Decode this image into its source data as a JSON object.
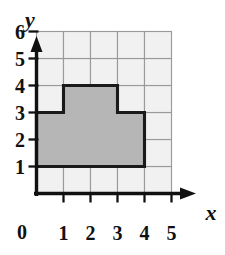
{
  "figure": {
    "kind": "coordinate-grid-shape",
    "background_color": "#ffffff"
  },
  "axes": {
    "x_name": "x",
    "y_name": "y",
    "origin_label": "0",
    "x_ticks": [
      "1",
      "2",
      "3",
      "4",
      "5"
    ],
    "y_ticks": [
      "1",
      "2",
      "3",
      "4",
      "5",
      "6"
    ],
    "axis_color": "#111111",
    "x_range": [
      0,
      5
    ],
    "y_range": [
      0,
      6
    ]
  },
  "grid": {
    "columns": 5,
    "rows": 6,
    "cell_fill": "#f1f1f1",
    "line_color": "#9a9a9a"
  },
  "chart_data": {
    "type": "scatter",
    "title": "",
    "xlabel": "x",
    "ylabel": "y",
    "xlim": [
      0,
      5
    ],
    "ylim": [
      0,
      6
    ],
    "xticks": [
      1,
      2,
      3,
      4,
      5
    ],
    "yticks": [
      1,
      2,
      3,
      4,
      5,
      6
    ],
    "grid": true,
    "legend": "none",
    "annotations": [],
    "shapes": [
      {
        "name": "shaded-step-polygon",
        "type": "polygon",
        "fill": "#b6b6b6",
        "stroke": "#1a1a1a",
        "closed": true,
        "vertices": [
          [
            0,
            1
          ],
          [
            4,
            1
          ],
          [
            4,
            3
          ],
          [
            3,
            3
          ],
          [
            3,
            4
          ],
          [
            1,
            4
          ],
          [
            1,
            3
          ],
          [
            0,
            3
          ]
        ],
        "area_square_units": 10,
        "perimeter_units": 16
      }
    ]
  }
}
